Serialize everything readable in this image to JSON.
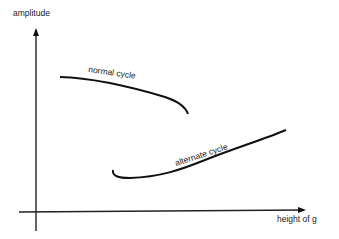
{
  "diagram": {
    "y_axis_label": "amplitude",
    "x_axis_label": "height of g",
    "curves": [
      {
        "name": "normal cycle",
        "label": "normal cycle"
      },
      {
        "name": "alternate cycle",
        "label": "alternate cycle"
      }
    ],
    "colors": {
      "stroke": "#111111",
      "background": "#ffffff"
    }
  }
}
